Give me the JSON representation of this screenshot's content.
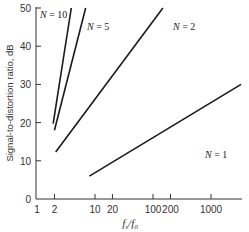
{
  "chart_data": {
    "type": "line",
    "title": "",
    "xlabel": "f_s/f_0",
    "ylabel": "Signal-to-distortion ratio, dB",
    "xscale": "log",
    "xlim": [
      1,
      3300
    ],
    "ylim": [
      0,
      50
    ],
    "x_ticks": [
      1,
      2,
      10,
      20,
      100,
      200,
      1000
    ],
    "x_tick_labels": [
      "1",
      "2",
      "10",
      "20",
      "100",
      "200",
      "1000"
    ],
    "y_ticks": [
      0,
      10,
      20,
      30,
      40,
      50
    ],
    "y_tick_labels": [
      "0",
      "10",
      "20",
      "30",
      "40",
      "50"
    ],
    "grid": false,
    "legend": "inline annotations",
    "series": [
      {
        "name": "N = 10",
        "label_N": "N",
        "label_val": " = 10",
        "x": [
          1.9,
          3.9
        ],
        "y": [
          19.7,
          50
        ]
      },
      {
        "name": "N = 5",
        "label_N": "N",
        "label_val": " = 5",
        "x": [
          2.0,
          6.9
        ],
        "y": [
          18,
          50
        ]
      },
      {
        "name": "N = 2",
        "label_N": "N",
        "label_val": " = 2",
        "x": [
          2.1,
          148
        ],
        "y": [
          12.3,
          50
        ]
      },
      {
        "name": "N = 1",
        "label_N": "N",
        "label_val": " = 1",
        "x": [
          8,
          3300
        ],
        "y": [
          6,
          30
        ]
      }
    ]
  }
}
